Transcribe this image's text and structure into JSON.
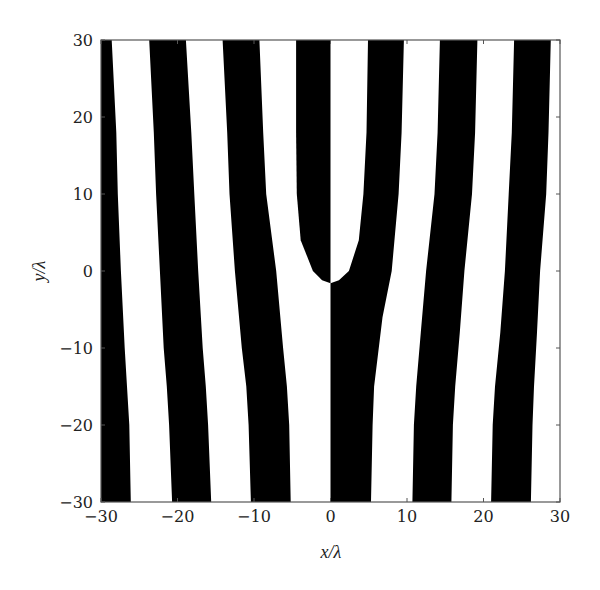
{
  "chart_data": {
    "type": "heatmap",
    "subtype": "binary fringe pattern (fork / dislocation hologram)",
    "title": "",
    "xlabel": "x/λ",
    "ylabel": "y/λ",
    "xlim": [
      -30,
      30
    ],
    "ylim": [
      -30,
      30
    ],
    "xticks": [
      -30,
      -20,
      -10,
      0,
      10,
      20,
      30
    ],
    "yticks": [
      -30,
      -20,
      -10,
      0,
      10,
      20,
      30
    ],
    "xtick_labels": [
      "−30",
      "−20",
      "−10",
      "0",
      "10",
      "20",
      "30"
    ],
    "ytick_labels": [
      "−30",
      "−20",
      "−10",
      "0",
      "10",
      "20",
      "30"
    ],
    "grid": false,
    "legend": null,
    "colors": {
      "fill": "#000000",
      "background": "#ffffff",
      "frame": "#555555"
    },
    "fringe_period_lambda": 10,
    "fork_point": {
      "x": 0,
      "y": -1.6
    },
    "black_bands": [
      {
        "name": "band-L4",
        "left": [
          [
            -30,
            30
          ],
          [
            -30,
            -30
          ]
        ],
        "right": [
          [
            -28.6,
            30
          ],
          [
            -28.0,
            18
          ],
          [
            -27.8,
            10
          ],
          [
            -27.4,
            0
          ],
          [
            -26.9,
            -10
          ],
          [
            -26.6,
            -15
          ],
          [
            -26.3,
            -20
          ],
          [
            -26.1,
            -30
          ]
        ]
      },
      {
        "name": "band-L3",
        "left": [
          [
            -23.7,
            30
          ],
          [
            -23.1,
            18
          ],
          [
            -22.8,
            10
          ],
          [
            -22.3,
            0
          ],
          [
            -21.8,
            -10
          ],
          [
            -21.4,
            -15
          ],
          [
            -21.1,
            -20
          ],
          [
            -20.7,
            -30
          ]
        ]
      },
      {
        "name": "band-L3r",
        "right": [
          [
            -18.9,
            30
          ],
          [
            -18.2,
            18
          ],
          [
            -17.8,
            10
          ],
          [
            -17.3,
            0
          ],
          [
            -16.7,
            -10
          ],
          [
            -16.3,
            -15
          ],
          [
            -16.0,
            -20
          ],
          [
            -15.6,
            -30
          ]
        ]
      },
      {
        "name": "band-L2",
        "left": [
          [
            -14.1,
            30
          ],
          [
            -13.5,
            18
          ],
          [
            -13.2,
            10
          ],
          [
            -12.5,
            0
          ],
          [
            -11.6,
            -10
          ],
          [
            -11.0,
            -15
          ],
          [
            -10.7,
            -20
          ],
          [
            -10.4,
            -30
          ]
        ]
      },
      {
        "name": "band-L2r",
        "right": [
          [
            -9.3,
            30
          ],
          [
            -8.8,
            18
          ],
          [
            -8.4,
            10
          ],
          [
            -7.1,
            0
          ],
          [
            -6.2,
            -10
          ],
          [
            -5.7,
            -15
          ],
          [
            -5.4,
            -20
          ],
          [
            -5.2,
            -30
          ]
        ]
      },
      {
        "name": "band-fork",
        "left": [
          [
            -4.5,
            30
          ],
          [
            -4.5,
            18
          ],
          [
            -4.4,
            10
          ],
          [
            -3.9,
            4
          ],
          [
            -2.3,
            0
          ],
          [
            -1.1,
            -1.2
          ],
          [
            0,
            -1.6
          ]
        ],
        "right": [
          [
            0,
            30
          ],
          [
            0,
            -1.6
          ]
        ]
      },
      {
        "name": "band-R1",
        "left": [
          [
            4.9,
            30
          ],
          [
            4.7,
            18
          ],
          [
            4.3,
            10
          ],
          [
            3.7,
            4
          ],
          [
            2.4,
            0
          ],
          [
            1.1,
            -1.2
          ],
          [
            0,
            -1.6
          ],
          [
            0,
            -30
          ]
        ],
        "right": [
          [
            9.6,
            30
          ],
          [
            9.3,
            18
          ],
          [
            8.9,
            10
          ],
          [
            8.0,
            0
          ],
          [
            6.8,
            -6
          ],
          [
            5.7,
            -15
          ],
          [
            5.5,
            -20
          ],
          [
            5.3,
            -30
          ]
        ]
      },
      {
        "name": "band-R2",
        "left": [
          [
            14.3,
            30
          ],
          [
            14.0,
            18
          ],
          [
            13.6,
            10
          ],
          [
            12.5,
            0
          ],
          [
            11.8,
            -8
          ],
          [
            11.2,
            -15
          ],
          [
            10.9,
            -20
          ],
          [
            10.7,
            -30
          ]
        ],
        "right": [
          [
            19.2,
            30
          ],
          [
            18.9,
            18
          ],
          [
            18.5,
            10
          ],
          [
            17.5,
            0
          ],
          [
            16.9,
            -8
          ],
          [
            16.3,
            -15
          ],
          [
            16.0,
            -20
          ],
          [
            15.8,
            -30
          ]
        ]
      },
      {
        "name": "band-R3",
        "left": [
          [
            24.0,
            30
          ],
          [
            23.7,
            18
          ],
          [
            23.3,
            10
          ],
          [
            22.8,
            0
          ],
          [
            22.2,
            -8
          ],
          [
            21.5,
            -15
          ],
          [
            21.2,
            -20
          ],
          [
            21.0,
            -30
          ]
        ],
        "right": [
          [
            28.8,
            30
          ],
          [
            28.5,
            18
          ],
          [
            28.2,
            10
          ],
          [
            27.4,
            0
          ],
          [
            27.0,
            -8
          ],
          [
            26.6,
            -15
          ],
          [
            26.4,
            -20
          ],
          [
            26.2,
            -30
          ]
        ]
      }
    ]
  },
  "axes": {
    "xlabel_main": "x",
    "xlabel_sep": "/λ",
    "ylabel_main": "y",
    "ylabel_sep": "/λ"
  }
}
